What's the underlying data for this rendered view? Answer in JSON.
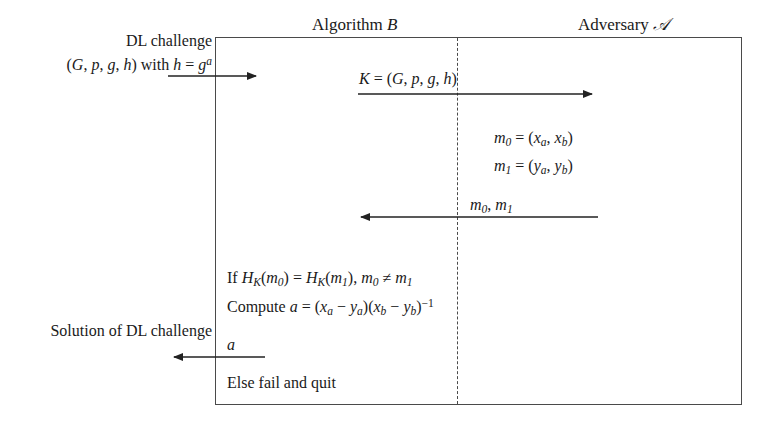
{
  "figure": {
    "type": "protocol-diagram",
    "background_color": "#ffffff",
    "line_color": "#4a4a4a",
    "text_color": "#1a1a1a"
  },
  "headings": {
    "left_party": "Algorithm B",
    "right_party": "Adversary A"
  },
  "left_annotations": {
    "challenge_line1": "DL challenge",
    "challenge_line2": "(G, p, g, h) with h = g",
    "challenge_exponent": "a",
    "solution": "Solution of DL challenge"
  },
  "messages": {
    "key_label_prefix": "K = (G, p, g, h)",
    "reply_label": "m",
    "reply_sub0": "0",
    "reply_sep": ", m",
    "reply_sub1": "1",
    "final_output": "a"
  },
  "adversary_block": {
    "m0_name": "m",
    "m0_sub": "0",
    "m0_value": " = (x",
    "m0_sub_a": "a",
    "m0_mid": ", x",
    "m0_sub_b": "b",
    "m0_end": ")",
    "m1_name": "m",
    "m1_sub": "1",
    "m1_value": " = (y",
    "m1_sub_a": "a",
    "m1_mid": ", y",
    "m1_sub_b": "b",
    "m1_end": ")"
  },
  "algorithm_block": {
    "if_prefix": "If H",
    "if_sub_k": "K",
    "if_m0": "(m",
    "if_m0_sub": "0",
    "if_eq": ") = H",
    "if_sub_k2": "K",
    "if_m1": "(m",
    "if_m1_sub": "1",
    "if_tail": "), m",
    "if_tail_sub0": "0",
    "if_neq": " ≠ m",
    "if_tail_sub1": "1",
    "compute_prefix": "Compute a = (x",
    "compute_sub_a1": "a",
    "compute_minus1": " − y",
    "compute_sub_a2": "a",
    "compute_mid": ")(x",
    "compute_sub_b1": "b",
    "compute_minus2": " − y",
    "compute_sub_b2": "b",
    "compute_close": ")",
    "compute_exponent": "−1",
    "else_text": "Else fail and quit"
  },
  "arrows": [
    {
      "name": "challenge-in-arrow",
      "direction": "right",
      "x1": 168,
      "x2": 262,
      "y": 76
    },
    {
      "name": "key-send-arrow",
      "direction": "right",
      "x1": 358,
      "x2": 598,
      "y": 94
    },
    {
      "name": "messages-return-arrow",
      "direction": "left",
      "x1": 598,
      "x2": 355,
      "y": 217
    },
    {
      "name": "solution-out-arrow",
      "direction": "left",
      "x1": 265,
      "x2": 168,
      "y": 357
    }
  ]
}
